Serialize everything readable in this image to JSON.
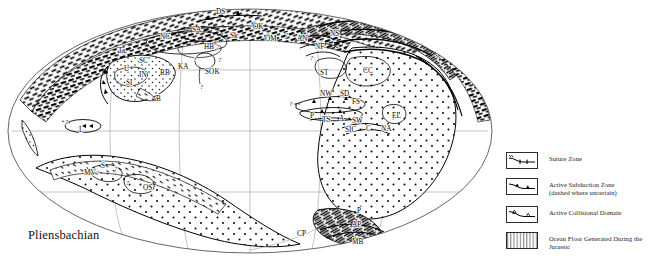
{
  "figure": {
    "stage_title": "Pliensbachian",
    "projection": "mollweide-ellipse"
  },
  "legend": {
    "entries": [
      {
        "symbol": "suture-zone-symbol",
        "label": "Suture Zone",
        "sublabel": ""
      },
      {
        "symbol": "active-subduction-zone-symbol",
        "label": "Active Subduction Zone",
        "sublabel": "(dashed where uncertain)"
      },
      {
        "symbol": "active-collisional-domain-symbol",
        "label": "Active Collisional Domain",
        "sublabel": ""
      },
      {
        "symbol": "jurassic-ocean-floor-symbol",
        "label": "Ocean Floor Generated During the Jurassic",
        "sublabel": ""
      }
    ]
  },
  "map_labels": [
    {
      "text": "DS",
      "x": 216,
      "y": 9
    },
    {
      "text": "SA",
      "x": 192,
      "y": 27
    },
    {
      "text": "Sk",
      "x": 230,
      "y": 33
    },
    {
      "text": "OK",
      "x": 253,
      "y": 24
    },
    {
      "text": "OM",
      "x": 265,
      "y": 36
    },
    {
      "text": "?",
      "x": 285,
      "y": 32
    },
    {
      "text": "AN",
      "x": 297,
      "y": 36
    },
    {
      "text": "NF",
      "x": 315,
      "y": 44
    },
    {
      "text": "NS",
      "x": 330,
      "y": 31
    },
    {
      "text": "NC",
      "x": 160,
      "y": 34
    },
    {
      "text": "HB",
      "x": 204,
      "y": 44
    },
    {
      "text": "?",
      "x": 216,
      "y": 44
    },
    {
      "text": "?",
      "x": 193,
      "y": 57
    },
    {
      "text": "?",
      "x": 218,
      "y": 57
    },
    {
      "text": "SOK",
      "x": 205,
      "y": 69
    },
    {
      "text": "?",
      "x": 200,
      "y": 84
    },
    {
      "text": "KA",
      "x": 178,
      "y": 64
    },
    {
      "text": "Ta",
      "x": 118,
      "y": 48
    },
    {
      "text": "SC",
      "x": 139,
      "y": 58
    },
    {
      "text": "U",
      "x": 124,
      "y": 66
    },
    {
      "text": "RB",
      "x": 160,
      "y": 70
    },
    {
      "text": "IN",
      "x": 139,
      "y": 72
    },
    {
      "text": "SI",
      "x": 126,
      "y": 80
    },
    {
      "text": "B",
      "x": 156,
      "y": 96
    },
    {
      "text": "ST",
      "x": 320,
      "y": 70
    },
    {
      "text": "?",
      "x": 310,
      "y": 55
    },
    {
      "text": "CC",
      "x": 363,
      "y": 68
    },
    {
      "text": "NW",
      "x": 320,
      "y": 91
    },
    {
      "text": "SD",
      "x": 340,
      "y": 91
    },
    {
      "text": "FS",
      "x": 352,
      "y": 99
    },
    {
      "text": "?",
      "x": 289,
      "y": 101
    },
    {
      "text": "P",
      "x": 310,
      "y": 113
    },
    {
      "text": "TS",
      "x": 322,
      "y": 117
    },
    {
      "text": "A",
      "x": 339,
      "y": 116
    },
    {
      "text": "SW",
      "x": 352,
      "y": 118
    },
    {
      "text": "SIC",
      "x": 345,
      "y": 127
    },
    {
      "text": "C",
      "x": 366,
      "y": 126
    },
    {
      "text": "NA",
      "x": 381,
      "y": 126
    },
    {
      "text": "EL",
      "x": 392,
      "y": 113
    },
    {
      "text": "?",
      "x": 65,
      "y": 119
    },
    {
      "text": "L",
      "x": 79,
      "y": 127
    },
    {
      "text": "MV",
      "x": 84,
      "y": 170
    },
    {
      "text": "?",
      "x": 96,
      "y": 170
    },
    {
      "text": "S",
      "x": 101,
      "y": 163
    },
    {
      "text": "?",
      "x": 114,
      "y": 166
    },
    {
      "text": "?",
      "x": 126,
      "y": 180
    },
    {
      "text": "OS",
      "x": 143,
      "y": 185
    },
    {
      "text": "CP",
      "x": 297,
      "y": 231
    },
    {
      "text": "MB",
      "x": 352,
      "y": 239
    },
    {
      "text": "AP",
      "x": 352,
      "y": 222
    },
    {
      "text": "P",
      "x": 357,
      "y": 208
    }
  ],
  "colors": {
    "ink": "#000000",
    "paper": "#ffffff",
    "graticule": "#9a9a9a",
    "outline": "#444444"
  }
}
